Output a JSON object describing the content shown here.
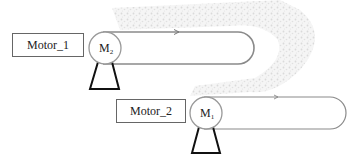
{
  "diagram": {
    "motors": [
      {
        "id": "motor_1",
        "label": "Motor_1",
        "symbol": "M",
        "subscript": "2"
      },
      {
        "id": "motor_2",
        "label": "Motor_2",
        "symbol": "M",
        "subscript": "1"
      }
    ],
    "colors": {
      "belt": "#8a8a8a",
      "motor_circle": "#999999",
      "stand": "#111111",
      "label_border": "#666666",
      "background_texture": "#e6e6e6"
    }
  }
}
